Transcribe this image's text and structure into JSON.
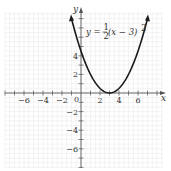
{
  "chart_data": {
    "type": "line",
    "title": "",
    "equation_label": "y = ½(x − 3)²",
    "equation_parts": {
      "lhs": "y =",
      "num": "1",
      "den": "2",
      "rhs": "(x − 3)",
      "exp": "2"
    },
    "function": "0.5*(x-3)^2",
    "x": [
      -1,
      0,
      1,
      2,
      3,
      4,
      5,
      6,
      7
    ],
    "y": [
      8,
      4.5,
      2,
      0.5,
      0,
      0.5,
      2,
      4.5,
      8
    ],
    "vertex": [
      3,
      0
    ],
    "xlabel": "x",
    "ylabel": "y",
    "xlim": [
      -8,
      8.5
    ],
    "ylim": [
      -8,
      9
    ],
    "x_ticks": [
      -6,
      -4,
      -2,
      2,
      4,
      6
    ],
    "y_ticks": [
      -6,
      -4,
      -2,
      2,
      4
    ],
    "origin_label": "0",
    "grid": true,
    "legend": null,
    "colors": {
      "curve": "#1a1a1a",
      "grid": "#e6e6e6",
      "axis": "#555555"
    }
  }
}
